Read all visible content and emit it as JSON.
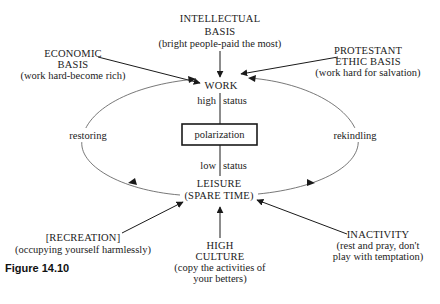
{
  "diagram": {
    "center": {
      "top_node": "WORK",
      "bottom_node_line1": "LEISURE",
      "bottom_node_line2": "(SPARE TIME)",
      "box_label": "polarization",
      "upper_link_label": "high status",
      "lower_link_label": "low status"
    },
    "cycle": {
      "left_label": "restoring",
      "right_label": "rekindling"
    },
    "work_inputs": [
      {
        "id": "intellectual",
        "line1": "INTELLECTUAL",
        "line2": "BASIS",
        "line3": "(bright people-paid the most)"
      },
      {
        "id": "economic",
        "line1": "ECONOMIC",
        "line2": "BASIS",
        "line3": "(work hard-become rich)"
      },
      {
        "id": "protestant",
        "line1": "PROTESTANT",
        "line2": "ETHIC BASIS",
        "line3": "(work hard for salvation)"
      }
    ],
    "leisure_inputs": [
      {
        "id": "recreation",
        "line1": "[RECREATION]",
        "line2": "(occupying yourself harmlessly)"
      },
      {
        "id": "high_culture",
        "line1": "HIGH",
        "line2": "CULTURE",
        "line3": "(copy the activities of",
        "line4": "your betters)"
      },
      {
        "id": "inactivity",
        "line1": "INACTIVITY",
        "line2": "(rest and pray, don't",
        "line3": "play with temptation)"
      }
    ],
    "caption": "Figure 14.10",
    "colors": {
      "ink": "#222222",
      "background": "#ffffff"
    }
  }
}
